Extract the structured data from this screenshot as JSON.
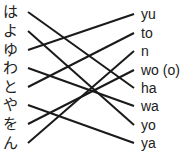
{
  "left_items": [
    {
      "label": "は",
      "y": 12,
      "match": 4
    },
    {
      "label": "よ",
      "y": 31,
      "match": 6
    },
    {
      "label": "ゆ",
      "y": 50,
      "match": 0
    },
    {
      "label": "わ",
      "y": 68,
      "match": 5
    },
    {
      "label": "と",
      "y": 87,
      "match": 1
    },
    {
      "label": "や",
      "y": 105,
      "match": 7
    },
    {
      "label": "を",
      "y": 124,
      "match": 3
    },
    {
      "label": "ん",
      "y": 143,
      "match": 2
    }
  ],
  "right_items": [
    {
      "label": "yu",
      "y": 14
    },
    {
      "label": "to",
      "y": 33
    },
    {
      "label": "n",
      "y": 51
    },
    {
      "label": "wo (o)",
      "y": 70
    },
    {
      "label": "ha",
      "y": 88
    },
    {
      "label": "wa",
      "y": 106
    },
    {
      "label": "yo",
      "y": 125
    },
    {
      "label": "ya",
      "y": 143
    }
  ],
  "line_color": "#1a1a1a"
}
